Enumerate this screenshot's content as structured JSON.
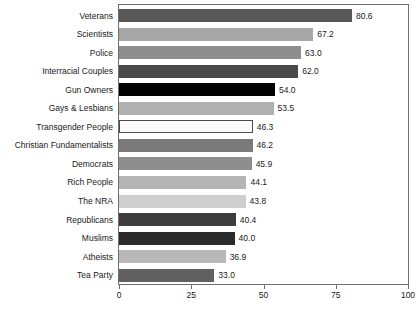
{
  "chart_data": {
    "type": "bar",
    "orientation": "horizontal",
    "title": "",
    "xlabel": "",
    "ylabel": "",
    "xlim": [
      0,
      100
    ],
    "xticks": [
      0,
      25,
      50,
      75,
      100
    ],
    "xtick_labels": [
      "0",
      "25",
      "50",
      "75",
      "100"
    ],
    "grid": false,
    "legend": false,
    "categories": [
      "Veterans",
      "Scientists",
      "Police",
      "Interracial Couples",
      "Gun Owners",
      "Gays & Lesbians",
      "Transgender People",
      "Christian Fundamentalists",
      "Democrats",
      "Rich People",
      "The NRA",
      "Republicans",
      "Muslims",
      "Atheists",
      "Tea Party"
    ],
    "values": [
      80.6,
      67.2,
      63.0,
      62.0,
      54.0,
      53.5,
      46.3,
      46.2,
      45.9,
      44.1,
      43.8,
      40.4,
      40.0,
      36.9,
      33.0
    ],
    "value_labels": [
      "80.6",
      "67.2",
      "63.0",
      "62.0",
      "54.0",
      "53.5",
      "46.3",
      "46.2",
      "45.9",
      "44.1",
      "43.8",
      "40.4",
      "40.0",
      "36.9",
      "33.0"
    ],
    "bar_colors": [
      "#585858",
      "#a8a8a8",
      "#8e8e8e",
      "#4a4a4a",
      "#000000",
      "#b0b0b0",
      "#fbfbfb",
      "#7a7a7a",
      "#8e8e8e",
      "#b4b4b4",
      "#cfcfcf",
      "#3d3d3d",
      "#2a2a2a",
      "#b8b8b8",
      "#606060"
    ],
    "bar_outlined": [
      false,
      false,
      false,
      false,
      false,
      false,
      true,
      false,
      false,
      false,
      false,
      false,
      false,
      false,
      false
    ]
  },
  "axis": {
    "frame_color": "#6f6f6f",
    "text_color": "#1a1a1a"
  }
}
